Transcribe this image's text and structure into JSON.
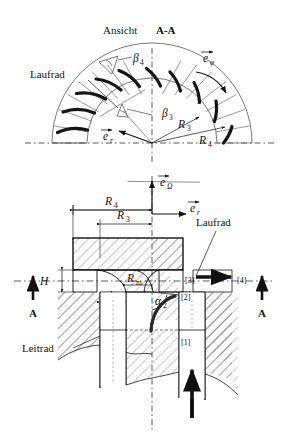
{
  "figure": {
    "title_prefix": "Ansicht ",
    "title_section": "A-A",
    "background_color": "#ffffff",
    "line_color": "#111111",
    "blade_color": "#1a1a1a",
    "hatch_color": "#6f6f6f"
  },
  "top_view": {
    "name": "Ansicht A-A",
    "component_label": "Laufrad",
    "angles": [
      {
        "symbol": "β",
        "sub": "4"
      },
      {
        "symbol": "β",
        "sub": "3"
      }
    ],
    "radii": [
      {
        "symbol": "R",
        "sub": "3"
      },
      {
        "symbol": "R",
        "sub": "4"
      }
    ],
    "vectors": [
      {
        "symbol": "e",
        "sub": "φ"
      },
      {
        "symbol": "e",
        "sub": "r"
      }
    ],
    "blade_count": 9,
    "beta4_label": "β4",
    "beta3_label": "β3",
    "r3_label": "R3",
    "r4_label": "R4",
    "e_phi_label": "eφ",
    "e_r_label": "er"
  },
  "section_view": {
    "component_labels": {
      "impeller": "Laufrad",
      "stator": "Leitrad"
    },
    "dimensions": [
      {
        "symbol": "R",
        "sub": "4"
      },
      {
        "symbol": "R",
        "sub": "3"
      },
      {
        "symbol": "R",
        "sub": "m"
      },
      {
        "symbol": "H",
        "sub": ""
      },
      {
        "symbol": "h",
        "sub": ""
      }
    ],
    "r4_label": "R4",
    "r3_label": "R3",
    "rm_label": "Rm",
    "h_upper_label": "H",
    "h_lower_label": "h",
    "angle": {
      "symbol": "α",
      "sub": "2"
    },
    "alpha2_label": "α2",
    "vectors": [
      {
        "symbol": "e",
        "sub": "Ω"
      },
      {
        "symbol": "e",
        "sub": "r"
      }
    ],
    "e_omega_label": "eΩ",
    "e_r_label": "er",
    "stations": [
      {
        "id": "[1]"
      },
      {
        "id": "[2]"
      },
      {
        "id": "[3]"
      },
      {
        "id": "[4]"
      }
    ],
    "station_1": "[1]",
    "station_2": "[2]",
    "station_3": "[3]",
    "station_4": "[4]",
    "section_markers": [
      {
        "label": "A",
        "side": "left"
      },
      {
        "label": "A",
        "side": "right"
      }
    ],
    "section_label_left": "A",
    "section_label_right": "A"
  }
}
